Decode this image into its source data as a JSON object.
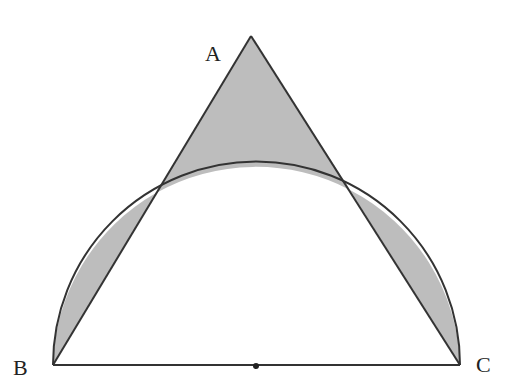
{
  "diagram": {
    "type": "geometry",
    "points": {
      "A": {
        "label": "A",
        "x": 251,
        "y": 36
      },
      "B": {
        "label": "B",
        "x": 53,
        "y": 365
      },
      "C": {
        "label": "C",
        "x": 460,
        "y": 365
      },
      "O": {
        "label": "",
        "x": 256,
        "y": 365
      }
    },
    "intersections": {
      "left": {
        "x": 156,
        "y": 193
      },
      "right": {
        "x": 350,
        "y": 190
      }
    },
    "semicircle": {
      "center": "O",
      "radius": 203.5
    },
    "colors": {
      "stroke": "#333333",
      "shade": "#bdbdbd",
      "background": "#ffffff"
    }
  }
}
